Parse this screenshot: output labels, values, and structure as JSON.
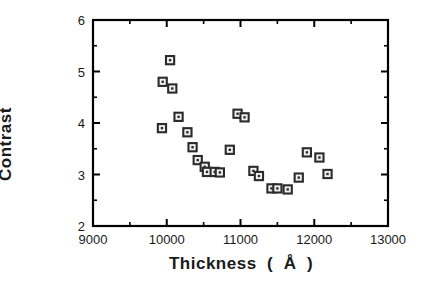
{
  "chart_data": {
    "type": "scatter",
    "title": "",
    "xlabel": "Thickness  (  Å  )",
    "ylabel": "Contrast",
    "xlim": [
      9000,
      13000
    ],
    "ylim": [
      2,
      6
    ],
    "xticks": [
      9000,
      10000,
      11000,
      12000,
      13000
    ],
    "xtick_labels": [
      "9000",
      "10000",
      "11000",
      "12000",
      "13000"
    ],
    "yticks": [
      2,
      3,
      4,
      5,
      6
    ],
    "ytick_labels": [
      "2",
      "3",
      "4",
      "5",
      "6"
    ],
    "x_minor_ticks": [
      9500,
      10500,
      11500,
      12500
    ],
    "y_minor_ticks": [
      2.5,
      3.5,
      4.5,
      5.5
    ],
    "grid": false,
    "legend": null,
    "marker": "open-square-with-dot",
    "marker_color": "#2b2b2b",
    "frame_color": "#000000",
    "points": [
      {
        "x": 9935,
        "y": 3.9
      },
      {
        "x": 9945,
        "y": 4.8
      },
      {
        "x": 10045,
        "y": 5.22
      },
      {
        "x": 10075,
        "y": 4.67
      },
      {
        "x": 10160,
        "y": 4.12
      },
      {
        "x": 10280,
        "y": 3.82
      },
      {
        "x": 10350,
        "y": 3.53
      },
      {
        "x": 10420,
        "y": 3.28
      },
      {
        "x": 10515,
        "y": 3.15
      },
      {
        "x": 10545,
        "y": 3.05
      },
      {
        "x": 10650,
        "y": 3.05
      },
      {
        "x": 10720,
        "y": 3.04
      },
      {
        "x": 10855,
        "y": 3.48
      },
      {
        "x": 10960,
        "y": 4.18
      },
      {
        "x": 11055,
        "y": 4.11
      },
      {
        "x": 11175,
        "y": 3.07
      },
      {
        "x": 11250,
        "y": 2.97
      },
      {
        "x": 11420,
        "y": 2.73
      },
      {
        "x": 11500,
        "y": 2.73
      },
      {
        "x": 11640,
        "y": 2.71
      },
      {
        "x": 11790,
        "y": 2.94
      },
      {
        "x": 11900,
        "y": 3.43
      },
      {
        "x": 12070,
        "y": 3.33
      },
      {
        "x": 12180,
        "y": 3.01
      }
    ]
  }
}
